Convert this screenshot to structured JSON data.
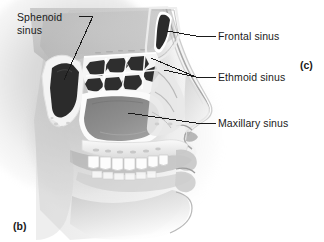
{
  "figure": {
    "part_markers": [
      {
        "id": "b",
        "text": "(b)"
      },
      {
        "id": "c",
        "text": "(c)"
      }
    ]
  },
  "labels": {
    "sphenoid": {
      "text": "Sphenoid sinus",
      "line1": "Sphenoid",
      "line2": "sinus"
    },
    "frontal": {
      "text": "Frontal sinus"
    },
    "ethmoid": {
      "text": "Ethmoid sinus"
    },
    "maxillary": {
      "text": "Maxillary sinus"
    }
  },
  "colors": {
    "background": "#ffffff",
    "leader_line": "#1a1a1a",
    "text": "#1a1a1a",
    "sinus_dark": "#2b2b2b",
    "sinus_mid": "#8d8d8d",
    "bone_light": "#f2f2f2",
    "bone_shade": "#b9b9b9",
    "tissue": "#c9c9c9",
    "tooth": "#fbfbfb"
  },
  "structures": [
    {
      "name": "sphenoid-sinus",
      "fill": "dark"
    },
    {
      "name": "frontal-sinus",
      "fill": "dark"
    },
    {
      "name": "ethmoid-air-cells",
      "fill": "dark-honeycomb"
    },
    {
      "name": "maxillary-sinus",
      "fill": "mid-gray"
    },
    {
      "name": "nasal-cavity",
      "fill": "light"
    },
    {
      "name": "hard-palate",
      "fill": "bone"
    },
    {
      "name": "upper-teeth",
      "fill": "tooth"
    },
    {
      "name": "lower-teeth",
      "fill": "tooth"
    },
    {
      "name": "lips-and-chin",
      "fill": "tissue"
    },
    {
      "name": "nose-profile",
      "fill": "tissue"
    }
  ]
}
